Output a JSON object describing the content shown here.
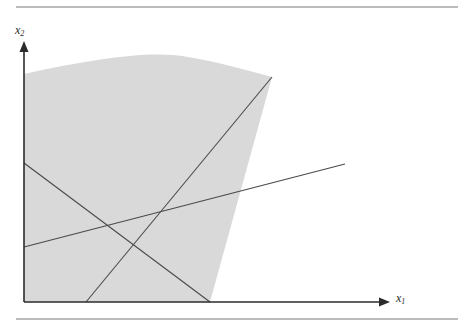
{
  "figure": {
    "kind": "math-diagram",
    "axes": {
      "x_label": "x",
      "x_label_sub": "1",
      "y_label": "x",
      "y_label_sub": "2",
      "origin": [
        24,
        302
      ],
      "x_axis_end": [
        390,
        302
      ],
      "y_axis_end": [
        24,
        42
      ],
      "color": "#2b2b2b"
    },
    "colors": {
      "shade_fill": "#d9d9d9",
      "line_stroke": "#4a4a4a",
      "axis_stroke": "#2b2b2b",
      "rule_stroke": "#7a7a7a",
      "background": "#ffffff"
    },
    "rules": [
      {
        "name": "top-rule",
        "x1": 16,
        "y1": 7,
        "x2": 458,
        "y2": 7
      },
      {
        "name": "bottom-rule",
        "x1": 16,
        "y1": 319,
        "x2": 458,
        "y2": 319
      }
    ],
    "shaded_region": {
      "name": "feasible-region",
      "fill": "#d9d9d9",
      "path": "M 24,302 L 24,74 C 60,66 96,59 130,56 C 152,54 170,54 188,57 C 214,61 242,69 272,77 L 210,302 Z",
      "top_curve_points": [
        [
          24,
          74
        ],
        [
          60,
          66
        ],
        [
          96,
          59
        ],
        [
          130,
          56
        ],
        [
          160,
          55
        ],
        [
          188,
          57
        ],
        [
          214,
          61
        ],
        [
          242,
          69
        ],
        [
          272,
          77
        ]
      ]
    },
    "lines": [
      {
        "name": "descending-steep-line",
        "x1": 24,
        "y1": 163,
        "x2": 210,
        "y2": 302,
        "stroke": "#4a4a4a",
        "width": 1
      },
      {
        "name": "ascending-steep-line",
        "x1": 86,
        "y1": 302,
        "x2": 272,
        "y2": 77,
        "stroke": "#4a4a4a",
        "width": 1
      },
      {
        "name": "ascending-shallow-line",
        "x1": 24,
        "y1": 247,
        "x2": 345,
        "y2": 164,
        "stroke": "#4a4a4a",
        "width": 1
      }
    ],
    "intersections": [
      {
        "name": "steep-lines-crossing",
        "x": 146,
        "y": 254
      },
      {
        "name": "shallow-with-ascending",
        "x": 215,
        "y": 215
      },
      {
        "name": "shallow-with-descending",
        "x": 112,
        "y": 229
      },
      {
        "name": "curve-meets-ascending",
        "x": 272,
        "y": 77
      }
    ]
  }
}
